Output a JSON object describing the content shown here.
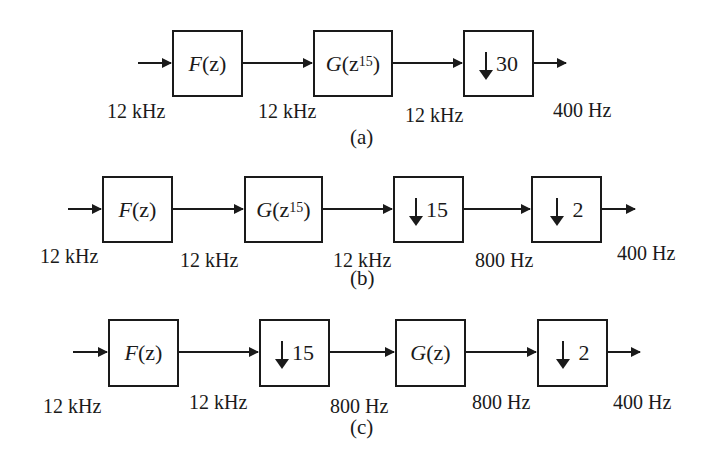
{
  "diagrams": [
    {
      "caption": "(a)",
      "blocks": [
        {
          "fn": "F",
          "arg": "(z)",
          "sup": ""
        },
        {
          "fn": "G",
          "arg": "(z",
          "sup": "15",
          "close": ")"
        },
        {
          "down": "30"
        }
      ],
      "rates": [
        "12 kHz",
        "12 kHz",
        "12 kHz",
        "400 Hz"
      ]
    },
    {
      "caption": "(b)",
      "blocks": [
        {
          "fn": "F",
          "arg": "(z)"
        },
        {
          "fn": "G",
          "arg": "(z",
          "sup": "15",
          "close": ")"
        },
        {
          "down": "15"
        },
        {
          "down": "2"
        }
      ],
      "rates": [
        "12 kHz",
        "12 kHz",
        "12 kHz",
        "800 Hz",
        "400 Hz"
      ]
    },
    {
      "caption": "(c)",
      "blocks": [
        {
          "fn": "F",
          "arg": "(z)"
        },
        {
          "down": "15"
        },
        {
          "fn": "G",
          "arg": "(z)"
        },
        {
          "down": "2"
        }
      ],
      "rates": [
        "12 kHz",
        "12 kHz",
        "800 Hz",
        "800 Hz",
        "400 Hz"
      ]
    }
  ]
}
